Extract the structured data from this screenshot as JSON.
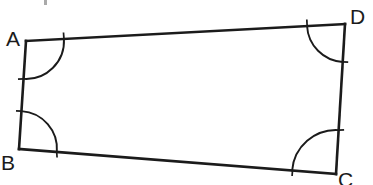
{
  "figure": {
    "name": "quadrilateral-ABCD",
    "type": "geometry-diagram",
    "background_color": "#ffffff",
    "stroke_color": "#1b1b1b",
    "label_color": "#1b1b1b",
    "edge_stroke_width": 2.6,
    "arc_stroke_width": 1.9,
    "labels": {
      "A": "A",
      "B": "B",
      "C": "C",
      "D": "D"
    },
    "vertices": [
      {
        "name": "A",
        "x": 26,
        "y": 41
      },
      {
        "name": "B",
        "x": 19,
        "y": 149
      },
      {
        "name": "C",
        "x": 336,
        "y": 174
      },
      {
        "name": "D",
        "x": 345,
        "y": 24
      }
    ],
    "edges": [
      {
        "name": "edge-AD",
        "from": "A",
        "to": "D"
      },
      {
        "name": "edge-DC",
        "from": "D",
        "to": "C"
      },
      {
        "name": "edge-CB",
        "from": "C",
        "to": "B"
      },
      {
        "name": "edge-BA",
        "from": "B",
        "to": "A"
      }
    ],
    "angle_arcs": [
      {
        "name": "angle-arc-A",
        "vertex": "A",
        "radius": 38
      },
      {
        "name": "angle-arc-B",
        "vertex": "B",
        "radius": 38
      },
      {
        "name": "angle-arc-C",
        "vertex": "C",
        "radius": 44
      },
      {
        "name": "angle-arc-D",
        "vertex": "D",
        "radius": 38
      }
    ]
  },
  "chart_data": {
    "type": "scatter",
    "title": "",
    "xlabel": "",
    "ylabel": "",
    "points": [
      {
        "label": "A",
        "x": 26,
        "y": 41
      },
      {
        "label": "B",
        "x": 19,
        "y": 149
      },
      {
        "label": "C",
        "x": 336,
        "y": 174
      },
      {
        "label": "D",
        "x": 345,
        "y": 24
      }
    ]
  }
}
